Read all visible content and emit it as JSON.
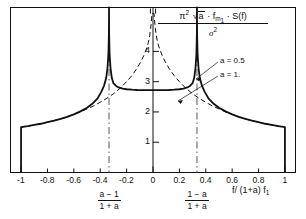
{
  "figure": {
    "type": "line-plot",
    "background": "#ffffff",
    "frame_color": "#111111"
  },
  "axes": {
    "x": {
      "label": "f/ (1+a) f",
      "label_sub": "1",
      "ticks": [
        -1,
        -0.8,
        -0.6,
        -0.4,
        -0.2,
        0,
        0.2,
        0.4,
        0.6,
        0.8,
        1
      ],
      "tick_labels": [
        "-1",
        "-0.8",
        "-0.6",
        "-0.4",
        "-0.2",
        "0",
        "0.2",
        "0.4",
        "0.6",
        "0.8",
        "1"
      ],
      "range": [
        -1.08,
        1.08
      ]
    },
    "y": {
      "label_numerator_parts": {
        "pi": "π",
        "pi_exp": "2",
        "radicand": "a",
        "mid": "· f",
        "f_sub": "m",
        "f_sub_sub": "1",
        "tail": "· S(f)"
      },
      "label_denominator": "σ",
      "label_denominator_exp": "2",
      "ticks": [
        1,
        2,
        3,
        4
      ],
      "tick_labels": [
        "1",
        "2",
        "3",
        "4"
      ],
      "range": [
        0,
        5.45
      ]
    }
  },
  "annotations": {
    "legend_a_half": "a = 0.5",
    "legend_a_one": "a = 1.",
    "left_pole_fraction": {
      "numerator": "a − 1",
      "denominator": "1 + a"
    },
    "right_pole_fraction": {
      "numerator": "1 − a",
      "denominator": "1 + a"
    }
  },
  "chart_data": {
    "type": "line",
    "title": "",
    "xlabel": "f/ (1+a) f1",
    "ylabel": "pi^2 sqrt(a) f_m1 S(f) / sigma^2",
    "xlim": [
      -1.08,
      1.08
    ],
    "ylim": [
      0,
      5.45
    ],
    "grid": false,
    "legend_position": "right-inside",
    "series": [
      {
        "name": "a = 0.5",
        "style": "solid",
        "pole_positions": [
          -0.3333,
          0.3333
        ],
        "edge_value_at_x_minus1": 1.5,
        "edge_value_at_x_plus1": 1.5,
        "min_value_at_x0": 2.72,
        "x": [
          -1.0,
          -1.0,
          -0.95,
          -0.9,
          -0.85,
          -0.8,
          -0.75,
          -0.7,
          -0.65,
          -0.6,
          -0.55,
          -0.5,
          -0.46,
          -0.42,
          -0.39,
          -0.37,
          -0.355,
          -0.345,
          -0.338,
          -0.334,
          -0.3333,
          -0.3327,
          -0.329,
          -0.322,
          -0.312,
          -0.3,
          -0.28,
          -0.26,
          -0.23,
          -0.2,
          -0.16,
          -0.12,
          -0.08,
          -0.04,
          0.0,
          0.04,
          0.08,
          0.12,
          0.16,
          0.2,
          0.23,
          0.26,
          0.28,
          0.3,
          0.312,
          0.322,
          0.329,
          0.3327,
          0.3333,
          0.334,
          0.338,
          0.345,
          0.355,
          0.37,
          0.39,
          0.42,
          0.46,
          0.5,
          0.55,
          0.6,
          0.65,
          0.7,
          0.75,
          0.8,
          0.85,
          0.9,
          0.95,
          1.0,
          1.0
        ],
        "y": [
          0.0,
          1.5,
          1.53,
          1.57,
          1.61,
          1.66,
          1.71,
          1.77,
          1.84,
          1.92,
          2.02,
          2.14,
          2.27,
          2.45,
          2.68,
          2.88,
          3.12,
          3.45,
          3.9,
          4.6,
          5.45,
          4.6,
          3.9,
          3.45,
          3.12,
          2.95,
          2.86,
          2.81,
          2.77,
          2.75,
          2.735,
          2.725,
          2.72,
          2.72,
          2.72,
          2.72,
          2.72,
          2.725,
          2.735,
          2.75,
          2.77,
          2.81,
          2.86,
          2.95,
          3.12,
          3.45,
          3.9,
          4.6,
          5.45,
          4.6,
          3.9,
          3.45,
          3.12,
          2.88,
          2.68,
          2.45,
          2.27,
          2.14,
          2.02,
          1.92,
          1.84,
          1.77,
          1.71,
          1.66,
          1.61,
          1.57,
          1.53,
          1.5,
          0.0
        ]
      },
      {
        "name": "a = 1.",
        "style": "dashed",
        "pole_positions": [
          0.0
        ],
        "edge_value_at_x_minus1": 1.5,
        "edge_value_at_x_plus1": 1.5,
        "x": [
          -1.0,
          -0.95,
          -0.9,
          -0.85,
          -0.8,
          -0.75,
          -0.7,
          -0.65,
          -0.6,
          -0.55,
          -0.5,
          -0.45,
          -0.4,
          -0.35,
          -0.3,
          -0.25,
          -0.2,
          -0.16,
          -0.12,
          -0.09,
          -0.07,
          -0.05,
          -0.035,
          -0.025,
          -0.018,
          -0.012,
          -0.008,
          0.008,
          0.012,
          0.018,
          0.025,
          0.035,
          0.05,
          0.07,
          0.09,
          0.12,
          0.16,
          0.2,
          0.25,
          0.3,
          0.35,
          0.4,
          0.45,
          0.5,
          0.55,
          0.6,
          0.65,
          0.7,
          0.75,
          0.8,
          0.85,
          0.9,
          0.95,
          1.0
        ],
        "y": [
          1.5,
          1.53,
          1.57,
          1.61,
          1.66,
          1.71,
          1.77,
          1.84,
          1.92,
          2.0,
          2.1,
          2.2,
          2.32,
          2.45,
          2.6,
          2.78,
          3.0,
          3.2,
          3.45,
          3.68,
          3.86,
          4.08,
          4.3,
          4.52,
          4.75,
          5.0,
          5.25,
          5.25,
          5.0,
          4.75,
          4.52,
          4.3,
          4.08,
          3.86,
          3.68,
          3.45,
          3.2,
          3.0,
          2.78,
          2.6,
          2.45,
          2.32,
          2.2,
          2.1,
          2.0,
          1.92,
          1.84,
          1.77,
          1.71,
          1.66,
          1.61,
          1.57,
          1.53,
          1.5
        ]
      }
    ],
    "vertical_reference_lines": [
      {
        "x": -0.3333,
        "style": "dash-dot",
        "label": "(a-1)/(1+a)"
      },
      {
        "x": 0.3333,
        "style": "dash-dot",
        "label": "(1-a)/(1+a)"
      }
    ]
  }
}
